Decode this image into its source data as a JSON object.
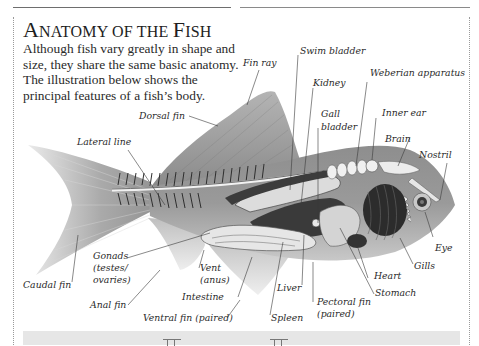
{
  "page": {
    "title_parts": [
      {
        "text": "A",
        "size": "big"
      },
      {
        "text": "NATOMY OF THE ",
        "size": "sc"
      },
      {
        "text": "F",
        "size": "big"
      },
      {
        "text": "ISH",
        "size": "sc"
      }
    ],
    "title": "Anatomy of the Fish",
    "intro_lines": [
      "Although fish vary greatly in shape and",
      "size, they share the same basic anatomy.",
      "The illustration below shows the",
      "principal features of a fish’s body."
    ]
  },
  "diagram": {
    "labels": {
      "fin_ray": "Fin ray",
      "swim_bladder": "Swim bladder",
      "kidney": "Kidney",
      "weberian_apparatus": "Weberian apparatus",
      "dorsal_fin": "Dorsal fin",
      "gall_bladder_1": "Gall",
      "gall_bladder_2": "bladder",
      "inner_ear": "Inner ear",
      "lateral_line": "Lateral line",
      "brain": "Brain",
      "nostril": "Nostril",
      "eye": "Eye",
      "gills": "Gills",
      "heart": "Heart",
      "stomach": "Stomach",
      "gonads_1": "Gonads",
      "gonads_2": "(testes/",
      "gonads_3": "ovaries)",
      "vent_1": "Vent",
      "vent_2": "(anus)",
      "caudal_fin": "Caudal fin",
      "intestine": "Intestine",
      "liver": "Liver",
      "anal_fin": "Anal fin",
      "pectoral_fin_1": "Pectoral fin",
      "pectoral_fin_2": "(paired)",
      "ventral_fin": "Ventral fin (paired)",
      "spleen": "Spleen"
    },
    "colors": {
      "body": "#8c8c8c",
      "fin": "#a8a8a8",
      "organ_dark": "#3a3a3a",
      "organ_light": "#d8d8d8",
      "text": "#2a2a2a"
    }
  },
  "footer": {
    "band_color": "#e6e6e6"
  }
}
